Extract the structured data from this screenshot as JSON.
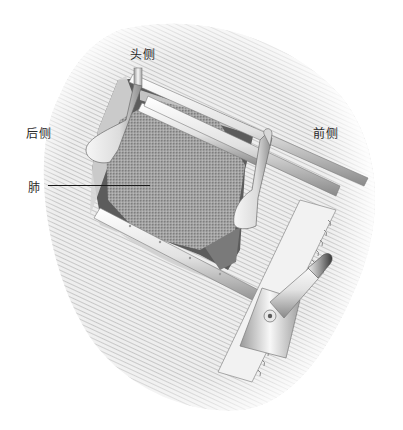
{
  "figure": {
    "labels": {
      "cranial": "头侧",
      "posterior": "后侧",
      "anterior": "前侧",
      "lung": "肺"
    },
    "colors": {
      "skin_hatch": "#c8c8c8",
      "skin_base": "#ececec",
      "cavity_dark": "#5a5a5a",
      "lung": "#a8a8a8",
      "metal_light": "#f4f4f4",
      "metal_shadow": "#8a8a8a",
      "leader_line": "#1a1a1a"
    }
  }
}
